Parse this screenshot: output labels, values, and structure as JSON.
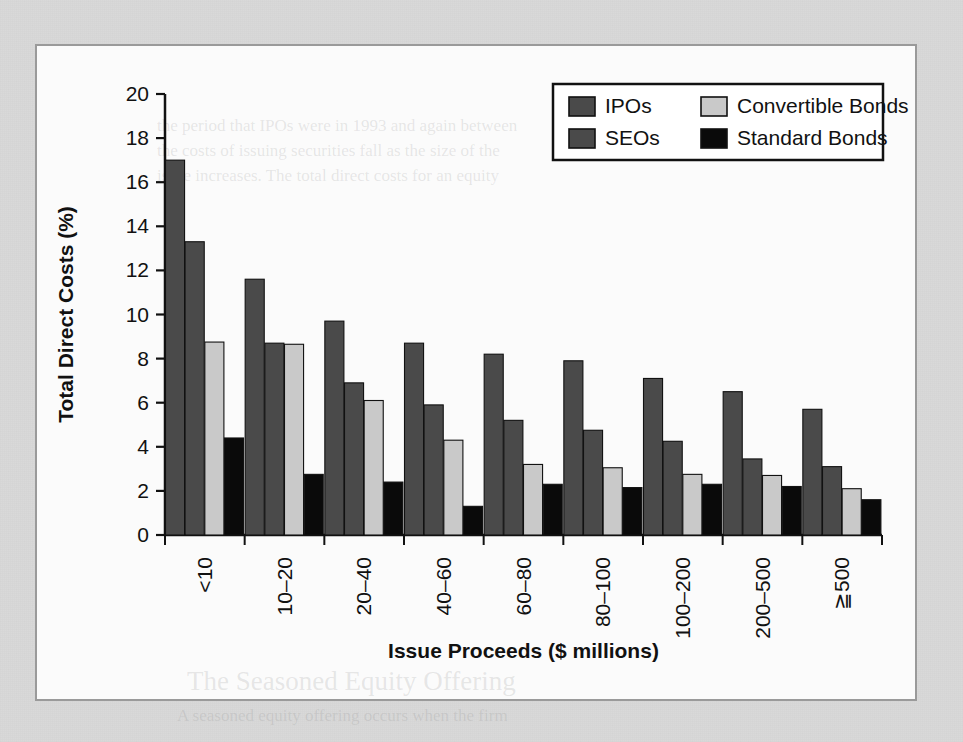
{
  "figure": {
    "background_color": "#d9d9d9",
    "panel_color": "#fbfbfb",
    "border_color": "#9a9a9a"
  },
  "ghost_text": [
    {
      "text": "the period that IPOs were in 1993 and again between",
      "x": 120,
      "y": 70,
      "size": 17
    },
    {
      "text": "the costs of issuing securities fall as the size of the",
      "x": 120,
      "y": 95,
      "size": 17
    },
    {
      "text": "issue increases. The total direct costs for an equity",
      "x": 120,
      "y": 120,
      "size": 17
    },
    {
      "text": "The Seasoned Equity Offering",
      "x": 150,
      "y": 620,
      "size": 27
    },
    {
      "text": "A seasoned equity offering occurs when the firm",
      "x": 140,
      "y": 660,
      "size": 17
    }
  ],
  "chart_data": {
    "type": "bar",
    "title": "",
    "xlabel": "Issue Proceeds ($ millions)",
    "ylabel": "Total Direct Costs (%)",
    "ylim": [
      0,
      20
    ],
    "ytick_step": 2,
    "yticks": [
      0,
      2,
      4,
      6,
      8,
      10,
      12,
      14,
      16,
      18,
      20
    ],
    "grid": false,
    "legend_position": "top-right",
    "xtick_rotation": -90,
    "categories": [
      "<10",
      "10–20",
      "20–40",
      "40–60",
      "60–80",
      "80–100",
      "100–200",
      "200–500",
      "≧500"
    ],
    "series": [
      {
        "name": "IPOs",
        "color": "#4a4a4a",
        "values": [
          17.0,
          11.6,
          9.7,
          8.7,
          8.2,
          7.9,
          7.1,
          6.5,
          5.7
        ]
      },
      {
        "name": "SEOs",
        "color": "#4a4a4a",
        "values": [
          13.3,
          8.7,
          6.9,
          5.9,
          5.2,
          4.75,
          4.25,
          3.45,
          3.1
        ]
      },
      {
        "name": "Convertible Bonds",
        "color": "#c9c9c9",
        "values": [
          8.75,
          8.65,
          6.1,
          4.3,
          3.2,
          3.05,
          2.75,
          2.7,
          2.1
        ]
      },
      {
        "name": "Standard Bonds",
        "color": "#0a0a0a",
        "values": [
          4.4,
          2.75,
          2.4,
          1.3,
          2.3,
          2.15,
          2.3,
          2.2,
          1.6
        ]
      }
    ]
  },
  "legend": {
    "entries": [
      {
        "label": "IPOs",
        "color": "#4a4a4a"
      },
      {
        "label": "Convertible Bonds",
        "color": "#c9c9c9"
      },
      {
        "label": "SEOs",
        "color": "#4a4a4a"
      },
      {
        "label": "Standard Bonds",
        "color": "#0a0a0a"
      }
    ]
  }
}
